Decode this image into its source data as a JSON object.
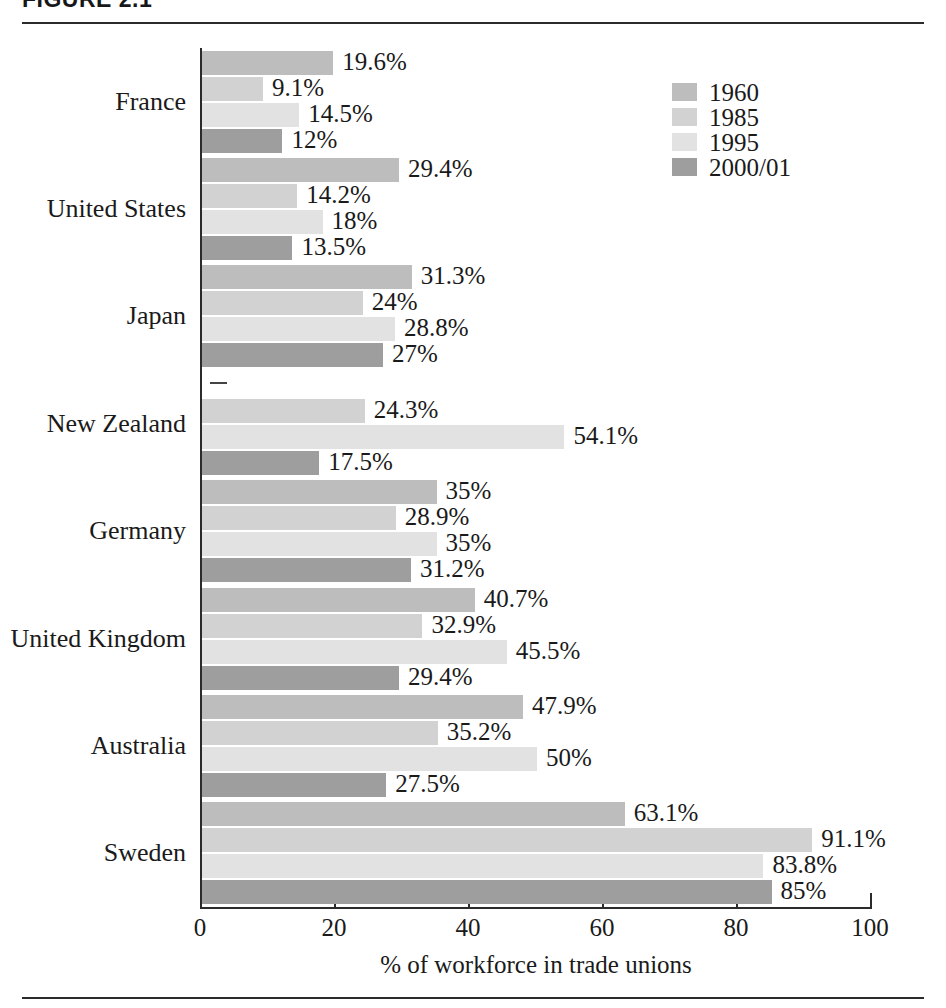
{
  "figure": {
    "title": "FIGURE 2.1",
    "top_rule": true,
    "bottom_rule": true
  },
  "legend": {
    "position": "top-right",
    "items": [
      {
        "label": "1960",
        "color": "#bdbdbd"
      },
      {
        "label": "1985",
        "color": "#d2d2d2"
      },
      {
        "label": "1995",
        "color": "#e2e2e2"
      },
      {
        "label": "2000/01",
        "color": "#9e9e9e"
      }
    ]
  },
  "chart_data": {
    "type": "bar",
    "orientation": "horizontal",
    "title": "FIGURE 2.1",
    "xlabel": "% of workforce in trade unions",
    "ylabel": "",
    "xlim": [
      0,
      100
    ],
    "xticks": [
      0,
      20,
      40,
      60,
      80,
      100
    ],
    "xtick_labels": [
      "0",
      "20",
      "40",
      "60",
      "80",
      "100"
    ],
    "grid": false,
    "legend_position": "top-right",
    "categories": [
      "France",
      "United States",
      "Japan",
      "New Zealand",
      "Germany",
      "United Kingdom",
      "Australia",
      "Sweden"
    ],
    "series": [
      {
        "name": "1960",
        "color": "#bdbdbd",
        "values": [
          19.6,
          29.4,
          31.3,
          null,
          35,
          40.7,
          47.9,
          63.1
        ],
        "labels": [
          "19.6%",
          "29.4%",
          "31.3%",
          "–",
          "35%",
          "40.7%",
          "47.9%",
          "63.1%"
        ]
      },
      {
        "name": "1985",
        "color": "#d2d2d2",
        "values": [
          9.1,
          14.2,
          24,
          24.3,
          28.9,
          32.9,
          35.2,
          91.1
        ],
        "labels": [
          "9.1%",
          "14.2%",
          "24%",
          "24.3%",
          "28.9%",
          "32.9%",
          "35.2%",
          "91.1%"
        ]
      },
      {
        "name": "1995",
        "color": "#e2e2e2",
        "values": [
          14.5,
          18,
          28.8,
          54.1,
          35,
          45.5,
          50,
          83.8
        ],
        "labels": [
          "14.5%",
          "18%",
          "28.8%",
          "54.1%",
          "35%",
          "45.5%",
          "50%",
          "83.8%"
        ]
      },
      {
        "name": "2000/01",
        "color": "#9e9e9e",
        "values": [
          12,
          13.5,
          27,
          17.5,
          31.2,
          29.4,
          27.5,
          85
        ],
        "labels": [
          "12%",
          "13.5%",
          "27%",
          "17.5%",
          "31.2%",
          "29.4%",
          "27.5%",
          "85%"
        ]
      }
    ]
  }
}
